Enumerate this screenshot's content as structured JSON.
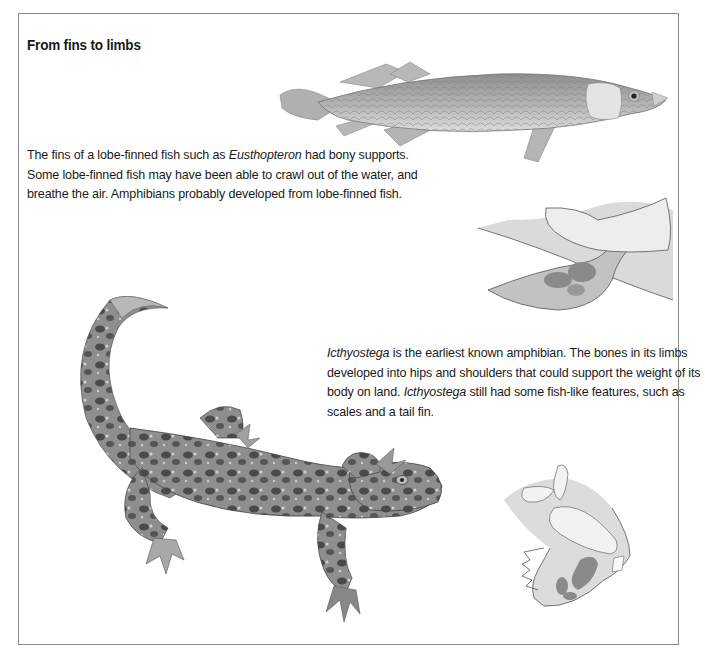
{
  "page": {
    "title": "From fins to limbs",
    "sections": [
      {
        "id": "lobe-finned-fish",
        "text_parts": [
          {
            "text": "The fins of a lobe-finned fish such as ",
            "italic": false
          },
          {
            "text": "Eusthopteron",
            "italic": true
          },
          {
            "text": " had bony supports. Some lobe-finned fish may have been able to crawl out of the water, and breathe the air. Amphibians probably developed from lobe-finned fish.",
            "italic": false
          }
        ]
      },
      {
        "id": "icthyostega",
        "text_parts": [
          {
            "text": "Icthyostega",
            "italic": true
          },
          {
            "text": " is the earliest known amphibian. The bones in its limbs developed into hips and shoulders that could support the weight of its body on land. ",
            "italic": false
          },
          {
            "text": "Icthyostega",
            "italic": true
          },
          {
            "text": " still had some fish-like features, such as scales and a tail fin.",
            "italic": false
          }
        ]
      }
    ],
    "illustrations": [
      {
        "name": "eusthenopteron-fish",
        "description": "lobe-finned fish illustration"
      },
      {
        "name": "fish-fin-bone-diagram",
        "description": "fin bone structure diagram"
      },
      {
        "name": "icthyostega-amphibian",
        "description": "spotted amphibian illustration"
      },
      {
        "name": "amphibian-limb-bone-diagram",
        "description": "limb bone structure diagram"
      }
    ],
    "colors": {
      "border": "#8a8a8a",
      "diagram_fill": "#c8c8c8",
      "diagram_bone_light": "#ececec",
      "diagram_bone_dark": "#8c8c8c",
      "fish_body": "#a9a9a9",
      "amphibian_body": "#8d8d8d"
    }
  }
}
